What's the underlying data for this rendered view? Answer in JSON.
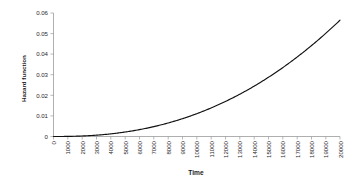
{
  "chart_data": {
    "type": "line",
    "title": "",
    "xlabel": "Time",
    "ylabel": "Hazard function",
    "xlim": [
      0,
      20000
    ],
    "ylim": [
      0,
      0.06
    ],
    "grid": false,
    "legend": false,
    "xticks": [
      0,
      1000,
      2000,
      3000,
      4000,
      5000,
      6000,
      7000,
      8000,
      9000,
      10000,
      11000,
      12000,
      13000,
      14000,
      15000,
      16000,
      17000,
      18000,
      19000,
      20000
    ],
    "xticklabels": [
      "0",
      "1000",
      "2000",
      "3000",
      "4000",
      "5000",
      "6000",
      "7000",
      "8000",
      "9000",
      "10000",
      "11000",
      "12000",
      "13000",
      "14000",
      "15000",
      "16000",
      "17000",
      "18000",
      "19000",
      "20000"
    ],
    "yticks": [
      0,
      0.01,
      0.02,
      0.03,
      0.04,
      0.05,
      0.06
    ],
    "yticklabels": [
      "0",
      "0.01",
      "0.02",
      "0.03",
      "0.04",
      "0.05",
      "0.06"
    ],
    "xtick_rotation": 90,
    "series": [
      {
        "name": "Hazard function",
        "color": "#111111",
        "x": [
          0,
          1000,
          2000,
          3000,
          4000,
          5000,
          6000,
          7000,
          8000,
          9000,
          10000,
          11000,
          12000,
          13000,
          14000,
          15000,
          16000,
          17000,
          18000,
          19000,
          20000
        ],
        "values": [
          0.0,
          0.0001,
          0.0005,
          0.0012,
          0.0023,
          0.0038,
          0.0057,
          0.008,
          0.0107,
          0.0138,
          0.0173,
          0.0213,
          0.0257,
          0.0305,
          0.0357,
          0.0413,
          0.0474,
          0.0538,
          0.0607,
          0.068,
          0.0757
        ]
      }
    ],
    "curve_note": "monotonic increasing convex power-law hazard, h(t) ~ (t/20000)^2.35 * 0.056"
  },
  "axes": {
    "axis_color": "#9a9a9a",
    "background": "#ffffff"
  }
}
